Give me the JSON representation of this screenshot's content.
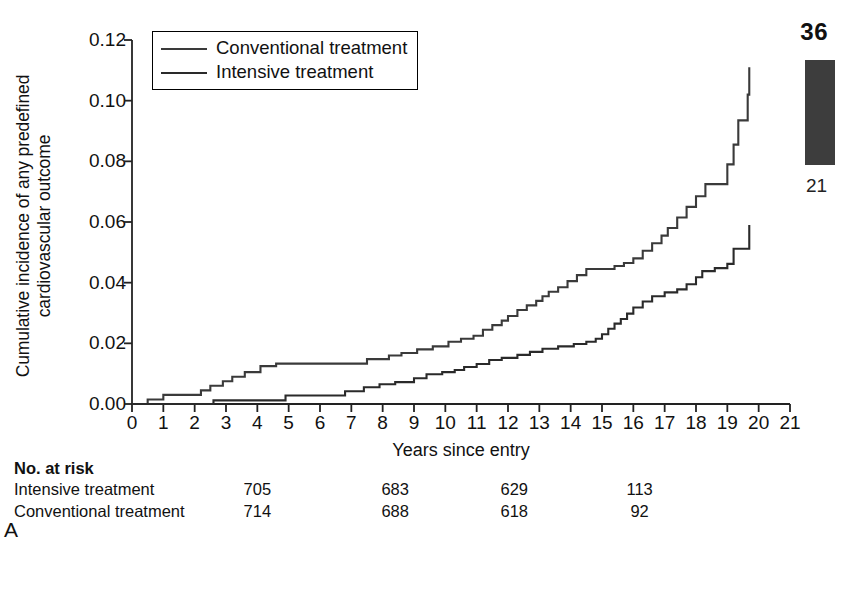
{
  "page": {
    "page_number": "36",
    "chapter_number": "21",
    "running_head": "Diabetes and Cardiovascular Diseas",
    "panel_letter": "A"
  },
  "axes": {
    "y_title_line1": "Cumulative incidence of any predefined",
    "y_title_line2": "cardiovascular outcome",
    "x_title": "Years since entry",
    "y_ticks": [
      "0.00",
      "0.02",
      "0.04",
      "0.06",
      "0.08",
      "0.10",
      "0.12"
    ],
    "y_tick_values": [
      0.0,
      0.02,
      0.04,
      0.06,
      0.08,
      0.1,
      0.12
    ],
    "x_ticks": [
      "0",
      "1",
      "2",
      "3",
      "4",
      "5",
      "6",
      "7",
      "8",
      "9",
      "10",
      "11",
      "12",
      "13",
      "14",
      "15",
      "16",
      "17",
      "18",
      "19",
      "20",
      "21"
    ],
    "x_tick_values": [
      0,
      1,
      2,
      3,
      4,
      5,
      6,
      7,
      8,
      9,
      10,
      11,
      12,
      13,
      14,
      15,
      16,
      17,
      18,
      19,
      20,
      21
    ]
  },
  "legend": {
    "position": "top-left-inside",
    "items": [
      {
        "label": "Conventional treatment",
        "style": "conv"
      },
      {
        "label": "Intensive treatment",
        "style": "int"
      }
    ]
  },
  "risk_table": {
    "header": "No. at risk",
    "rows": [
      {
        "name": "Intensive treatment",
        "values": [
          "705",
          "683",
          "629",
          "113"
        ]
      },
      {
        "name": "Conventional treatment",
        "values": [
          "714",
          "688",
          "618",
          "92"
        ]
      }
    ],
    "value_x_years": [
      4,
      8.4,
      12.2,
      16.2
    ]
  },
  "colors": {
    "conventional": "#3a3a3a",
    "intensive": "#2a2a2a",
    "axis": "#222222",
    "tab_block": "#3d3d3d"
  },
  "chart_data": {
    "type": "line",
    "subtype": "kaplan-meier-step",
    "title": "",
    "xlabel": "Years since entry",
    "ylabel": "Cumulative incidence of any predefined cardiovascular outcome",
    "xlim": [
      0,
      21
    ],
    "ylim": [
      0.0,
      0.12
    ],
    "grid": false,
    "legend_position": "upper left",
    "series": [
      {
        "name": "Conventional treatment",
        "color": "#3a3a3a",
        "points": [
          [
            0.0,
            0.0
          ],
          [
            0.5,
            0.0015
          ],
          [
            1.0,
            0.003
          ],
          [
            1.1,
            0.003
          ],
          [
            2.2,
            0.0045
          ],
          [
            2.5,
            0.006
          ],
          [
            2.9,
            0.0075
          ],
          [
            3.2,
            0.009
          ],
          [
            3.6,
            0.0105
          ],
          [
            4.1,
            0.0125
          ],
          [
            4.6,
            0.0133
          ],
          [
            7.2,
            0.0133
          ],
          [
            7.5,
            0.0148
          ],
          [
            8.2,
            0.016
          ],
          [
            8.6,
            0.0168
          ],
          [
            9.1,
            0.018
          ],
          [
            9.6,
            0.019
          ],
          [
            10.1,
            0.0205
          ],
          [
            10.5,
            0.0215
          ],
          [
            10.9,
            0.0225
          ],
          [
            11.2,
            0.0245
          ],
          [
            11.5,
            0.026
          ],
          [
            11.8,
            0.0275
          ],
          [
            12.0,
            0.029
          ],
          [
            12.3,
            0.031
          ],
          [
            12.6,
            0.0325
          ],
          [
            12.9,
            0.034
          ],
          [
            13.1,
            0.0355
          ],
          [
            13.3,
            0.037
          ],
          [
            13.6,
            0.0385
          ],
          [
            13.9,
            0.0405
          ],
          [
            14.2,
            0.0425
          ],
          [
            14.5,
            0.0445
          ],
          [
            15.4,
            0.0455
          ],
          [
            15.7,
            0.0465
          ],
          [
            16.0,
            0.048
          ],
          [
            16.3,
            0.0505
          ],
          [
            16.6,
            0.053
          ],
          [
            16.9,
            0.0555
          ],
          [
            17.1,
            0.058
          ],
          [
            17.4,
            0.0615
          ],
          [
            17.7,
            0.065
          ],
          [
            18.0,
            0.0685
          ],
          [
            18.3,
            0.0725
          ],
          [
            18.9,
            0.0725
          ],
          [
            19.0,
            0.079
          ],
          [
            19.2,
            0.0855
          ],
          [
            19.35,
            0.0935
          ],
          [
            19.55,
            0.0935
          ],
          [
            19.65,
            0.102
          ],
          [
            19.7,
            0.111
          ]
        ]
      },
      {
        "name": "Intensive treatment",
        "color": "#2a2a2a",
        "points": [
          [
            0.0,
            0.0
          ],
          [
            2.4,
            0.0
          ],
          [
            2.6,
            0.0012
          ],
          [
            4.6,
            0.0012
          ],
          [
            4.9,
            0.0028
          ],
          [
            6.4,
            0.0028
          ],
          [
            6.8,
            0.0042
          ],
          [
            7.4,
            0.0055
          ],
          [
            7.9,
            0.0065
          ],
          [
            8.4,
            0.0072
          ],
          [
            9.0,
            0.0085
          ],
          [
            9.4,
            0.0098
          ],
          [
            9.9,
            0.0105
          ],
          [
            10.3,
            0.0112
          ],
          [
            10.6,
            0.0122
          ],
          [
            11.0,
            0.0132
          ],
          [
            11.4,
            0.0145
          ],
          [
            11.8,
            0.0152
          ],
          [
            12.3,
            0.0162
          ],
          [
            12.7,
            0.0172
          ],
          [
            13.1,
            0.0182
          ],
          [
            13.6,
            0.019
          ],
          [
            14.1,
            0.0198
          ],
          [
            14.5,
            0.0205
          ],
          [
            14.8,
            0.0215
          ],
          [
            15.0,
            0.023
          ],
          [
            15.2,
            0.0248
          ],
          [
            15.4,
            0.0265
          ],
          [
            15.6,
            0.028
          ],
          [
            15.8,
            0.0298
          ],
          [
            16.0,
            0.0318
          ],
          [
            16.3,
            0.0338
          ],
          [
            16.6,
            0.0355
          ],
          [
            17.0,
            0.0368
          ],
          [
            17.4,
            0.0378
          ],
          [
            17.7,
            0.0395
          ],
          [
            18.0,
            0.0418
          ],
          [
            18.2,
            0.0438
          ],
          [
            18.6,
            0.0448
          ],
          [
            19.0,
            0.0462
          ],
          [
            19.2,
            0.0512
          ],
          [
            19.7,
            0.0512
          ],
          [
            19.7,
            0.059
          ]
        ]
      }
    ]
  }
}
